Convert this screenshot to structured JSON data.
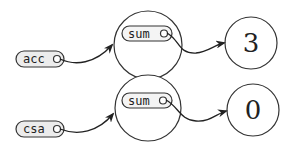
{
  "diagram": {
    "type": "pointer-diagram",
    "variables": [
      {
        "name": "acc",
        "target_object_field": "sum",
        "value": "3"
      },
      {
        "name": "csa",
        "target_object_field": "sum",
        "value": "0"
      }
    ],
    "rows": [
      {
        "var_label": "acc",
        "field_label": "sum",
        "value_label": "3"
      },
      {
        "var_label": "csa",
        "field_label": "sum",
        "value_label": "0"
      }
    ]
  }
}
